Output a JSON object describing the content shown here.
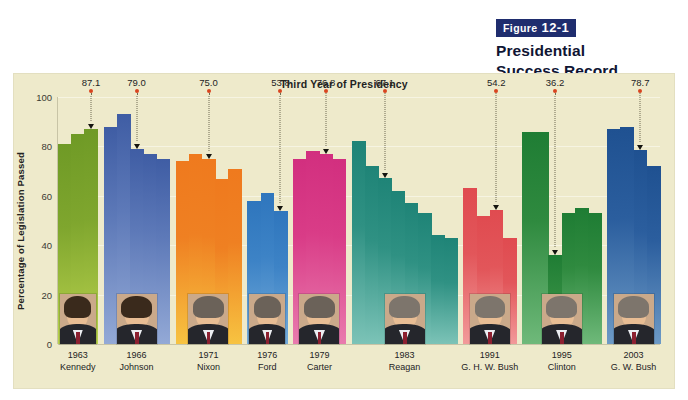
{
  "caption": {
    "badge_prefix": "Figure",
    "badge_number": "12-1",
    "line1": "Presidential",
    "line2": "Success Record"
  },
  "chart_data": {
    "type": "bar",
    "title": "Third Year of Presidency",
    "xlabel": "",
    "ylabel": "Percentage of Legislation Passed",
    "ylim": [
      0,
      100
    ],
    "yticks": [
      0,
      20,
      40,
      60,
      80,
      100
    ],
    "grid": true,
    "legend": "none",
    "background": "#eeeacb",
    "annotation_note": "Red dot + dotted leader marks the third year of each presidency",
    "groups": [
      {
        "year": "1963",
        "president": "Kennedy",
        "color": "#7fa62e",
        "color_top": "#6f9a26",
        "color_bottom": "#b9d24e",
        "values": [
          81,
          85,
          87.1
        ],
        "highlight_index": 2,
        "highlight_value": "87.1"
      },
      {
        "year": "1966",
        "president": "Johnson",
        "color": "#5d79b8",
        "color_top": "#3f5da4",
        "color_bottom": "#93a9d6",
        "values": [
          88,
          93,
          79.0,
          77,
          75
        ],
        "highlight_index": 2,
        "highlight_value": "79.0"
      },
      {
        "year": "1971",
        "president": "Nixon",
        "color": "#ef8022",
        "color_top": "#ef7a1e",
        "color_bottom": "#f7c341",
        "values": [
          74,
          77,
          75.0,
          67,
          71
        ],
        "highlight_index": 2,
        "highlight_value": "75.0"
      },
      {
        "year": "1976",
        "president": "Ford",
        "color": "#3d83c6",
        "color_top": "#2f76bd",
        "color_bottom": "#74abda",
        "values": [
          58,
          61,
          53.8
        ],
        "highlight_index": 2,
        "highlight_value": "53.8"
      },
      {
        "year": "1979",
        "president": "Carter",
        "color": "#d93c87",
        "color_top": "#d22f7f",
        "color_bottom": "#e97bae",
        "values": [
          75,
          78,
          76.8,
          75
        ],
        "highlight_index": 2,
        "highlight_value": "76.8"
      },
      {
        "year": "1983",
        "president": "Reagan",
        "color": "#2f9183",
        "color_top": "#1f8477",
        "color_bottom": "#7cc3b7",
        "values": [
          82,
          72,
          67.1,
          62,
          57,
          53,
          44,
          43
        ],
        "highlight_index": 2,
        "highlight_value": "67.1"
      },
      {
        "year": "1991",
        "president": "G. H. W. Bush",
        "color": "#e2565a",
        "color_top": "#e04b50",
        "color_bottom": "#f29a9a",
        "values": [
          63,
          52,
          54.2,
          43
        ],
        "highlight_index": 2,
        "highlight_value": "54.2"
      },
      {
        "year": "1995",
        "president": "Clinton",
        "color": "#2f8a3f",
        "color_top": "#1f7d34",
        "color_bottom": "#6fb97a",
        "values": [
          86,
          86,
          36.2,
          53,
          55,
          53
        ],
        "highlight_index": 2,
        "highlight_value": "36.2"
      },
      {
        "year": "2003",
        "president": "G. W. Bush",
        "color": "#2b5e9e",
        "color_top": "#1f5191",
        "color_bottom": "#6d9ac6",
        "values": [
          87,
          88,
          78.7,
          72
        ],
        "highlight_index": 2,
        "highlight_value": "78.7"
      }
    ]
  }
}
